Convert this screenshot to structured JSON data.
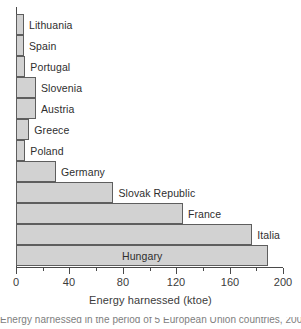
{
  "chart_data": {
    "type": "bar",
    "orientation": "horizontal",
    "title": "",
    "xlabel": "Energy harnessed (ktoe)",
    "ylabel": "",
    "xlim": [
      0,
      200
    ],
    "ylim": null,
    "grid": false,
    "legend": null,
    "xticks": [
      0,
      40,
      80,
      120,
      160,
      200
    ],
    "xtick_labels": [
      "0",
      "40",
      "80",
      "120",
      "160",
      "200"
    ],
    "minor_xticks": [
      20,
      60,
      100,
      140,
      180
    ],
    "categories": [
      "Lithuania",
      "Spain",
      "Portugal",
      "Slovenia",
      "Austria",
      "Greece",
      "Poland",
      "Germany",
      "Slovak Republic",
      "France",
      "Hungary"
    ],
    "values": [
      6,
      6,
      7,
      15,
      15,
      10,
      7,
      30,
      73,
      125,
      189
    ],
    "bars": [
      {
        "label": "Lithuania",
        "value": 6,
        "label_position": "outside"
      },
      {
        "label": "Spain",
        "value": 6,
        "label_position": "outside"
      },
      {
        "label": "Portugal",
        "value": 7,
        "label_position": "outside"
      },
      {
        "label": "Slovenia",
        "value": 15,
        "label_position": "outside"
      },
      {
        "label": "Austria",
        "value": 15,
        "label_position": "outside"
      },
      {
        "label": "Greece",
        "value": 10,
        "label_position": "outside"
      },
      {
        "label": "Poland",
        "value": 7,
        "label_position": "outside"
      },
      {
        "label": "Germany",
        "value": 30,
        "label_position": "outside"
      },
      {
        "label": "Slovak Republic",
        "value": 73,
        "label_position": "outside"
      },
      {
        "label": "France",
        "value": 125,
        "label_position": "outside"
      },
      {
        "label": "Italia",
        "value": 177,
        "label_position": "outside"
      },
      {
        "label": "Hungary",
        "value": 189,
        "label_position": "inside"
      }
    ],
    "colors": {
      "bar_fill": "#d2d2d2",
      "bar_edge": "#5e5e5e",
      "axis": "#4a4a4a",
      "text": "#2e2e2e",
      "background": "#ffffff"
    }
  },
  "axis": {
    "x_title": "Energy harnessed (ktoe)",
    "tick_0": "0",
    "tick_1": "40",
    "tick_2": "80",
    "tick_3": "120",
    "tick_4": "160",
    "tick_5": "200"
  },
  "labels": {
    "b0": "Lithuania",
    "b1": "Spain",
    "b2": "Portugal",
    "b3": "Slovenia",
    "b4": "Austria",
    "b5": "Greece",
    "b6": "Poland",
    "b7": "Germany",
    "b8": "Slovak Republic",
    "b9": "France",
    "b10": "Italia",
    "b11": "Hungary"
  },
  "caption": {
    "clipped_text": "Energy harnessed in the period of 5 European Union countries, 2006"
  }
}
